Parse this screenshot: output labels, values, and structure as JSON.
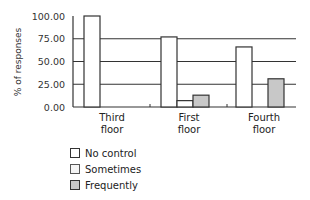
{
  "chart_data": {
    "type": "bar",
    "title": "",
    "xlabel": "",
    "ylabel": "% of responses",
    "ylim": [
      0,
      100
    ],
    "yticks": [
      "0.00",
      "25.00",
      "50.00",
      "75.00",
      "100.00"
    ],
    "grid": true,
    "legend_position": "bottom-left",
    "categories": [
      "Third floor",
      "First floor",
      "Fourth floor"
    ],
    "category_lines": [
      [
        "Third",
        "floor"
      ],
      [
        "First",
        "floor"
      ],
      [
        "Fourth",
        "floor"
      ]
    ],
    "series": [
      {
        "name": "No control",
        "color": "#ffffff",
        "values": [
          100,
          77,
          66
        ]
      },
      {
        "name": "Sometimes",
        "color": "#ffffff",
        "values": [
          0,
          7,
          0
        ]
      },
      {
        "name": "Frequently",
        "color": "#c8c8c8",
        "values": [
          0,
          13,
          31
        ]
      }
    ]
  },
  "legend": {
    "items": [
      {
        "label": "No control",
        "color": "#ffffff"
      },
      {
        "label": "Sometimes",
        "color": "#f4f4f4"
      },
      {
        "label": "Frequently",
        "color": "#c8c8c8"
      }
    ]
  }
}
